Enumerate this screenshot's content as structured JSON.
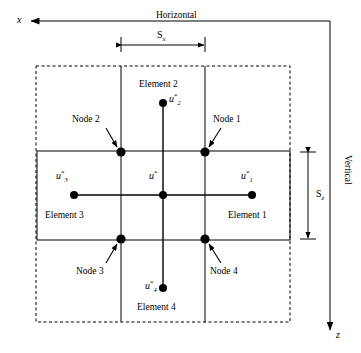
{
  "figure": {
    "axes": {
      "x_axis_label": "x",
      "z_axis_label": "z",
      "horizontal_label": "Horizontal",
      "vertical_label": "Vertical",
      "x_direction": "left",
      "z_direction": "down"
    },
    "dimensions": {
      "horizontal_spacing_label": "S",
      "horizontal_spacing_sub": "x",
      "vertical_spacing_label": "S",
      "vertical_spacing_sub": "z"
    },
    "elements": [
      {
        "label": "Element 1",
        "x": 228,
        "y": 215
      },
      {
        "label": "Element 2",
        "x": 140,
        "y": 84
      },
      {
        "label": "Element 3",
        "x": 45,
        "y": 215
      },
      {
        "label": "Element 4",
        "x": 138,
        "y": 306
      }
    ],
    "nodes": [
      {
        "label": "Node 1",
        "label_x": 214,
        "label_y": 119,
        "dot_x": 205,
        "dot_y": 152
      },
      {
        "label": "Node 2",
        "label_x": 73,
        "label_y": 119,
        "dot_x": 121,
        "dot_y": 152
      },
      {
        "label": "Node 3",
        "label_x": 77,
        "label_y": 270,
        "dot_x": 121,
        "dot_y": 239
      },
      {
        "label": "Node 4",
        "label_x": 211,
        "label_y": 270,
        "dot_x": 205,
        "dot_y": 239
      }
    ],
    "values": [
      {
        "symbol": "u",
        "sub": "1",
        "sup": "*",
        "x": 242,
        "y": 173,
        "dot_x": 252,
        "dot_y": 195
      },
      {
        "symbol": "u",
        "sub": "2",
        "sup": "*",
        "x": 170,
        "y": 96,
        "dot_x": 163,
        "dot_y": 103
      },
      {
        "symbol": "u",
        "sub": "3",
        "sup": "*",
        "x": 57,
        "y": 173,
        "dot_x": 74,
        "dot_y": 195
      },
      {
        "symbol": "u",
        "sub": "4",
        "sup": "*",
        "x": 146,
        "y": 283,
        "dot_x": 163,
        "dot_y": 288
      },
      {
        "symbol": "u",
        "sub": "",
        "sup": "*",
        "x": 150,
        "y": 173,
        "dot_x": 163,
        "dot_y": 195
      }
    ],
    "colors": {
      "stroke": "#000000",
      "background": "#ffffff"
    }
  }
}
